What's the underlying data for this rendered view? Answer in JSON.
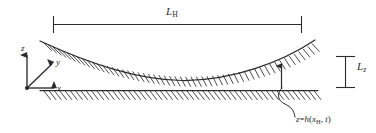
{
  "figure": {
    "name": "lubrication-gap-geometry",
    "width": 376,
    "height": 133,
    "background_color": "#ffffff",
    "ink_color": "#2b2b2b"
  },
  "labels": {
    "horizontal_dimension": {
      "base": "L",
      "subscript": "H",
      "full_text": "L_H",
      "role": "horizontal extent of the gap region"
    },
    "vertical_dimension": {
      "base": "L",
      "subscript": "z",
      "full_text": "L_z",
      "role": "vertical reference length"
    },
    "equation": {
      "lhs": "z",
      "relation": "=",
      "function": "h",
      "open_paren": "(",
      "arg1": "x",
      "arg1_subscript": "H",
      "comma": ", ",
      "arg2": "t",
      "close_paren": ")",
      "full_text": "z = h (x_H, t)",
      "role": "gap height function annotation"
    }
  },
  "axes": {
    "origin_label": "",
    "items": [
      {
        "label": "z",
        "direction": "up"
      },
      {
        "label": "y",
        "direction": "diagonal-up-right"
      },
      {
        "label": "x",
        "direction": "right"
      }
    ]
  },
  "surfaces": [
    {
      "name": "upper-curved-surface",
      "type": "curve",
      "hatching": "below",
      "description": "concave-up curved boundary"
    },
    {
      "name": "lower-flat-surface",
      "type": "line",
      "hatching": "below",
      "description": "horizontal straight boundary"
    }
  ],
  "annotations": {
    "gap_arrow": {
      "name": "gap-height-arrow",
      "style": "double-headed vertical arrow"
    },
    "leader_line": {
      "name": "equation-leader-line",
      "style": "curved leader from lower surface to equation"
    }
  }
}
